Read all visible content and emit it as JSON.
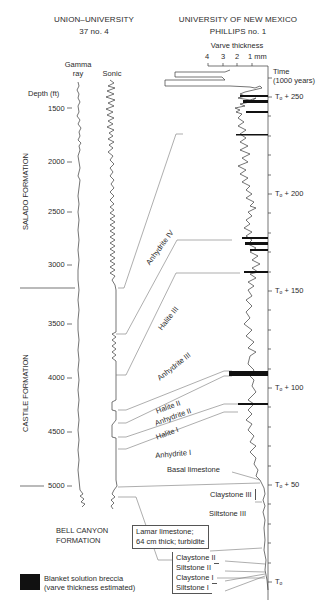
{
  "headers": {
    "left_well": {
      "line1": "UNION–UNIVERSITY",
      "line2": "37 no. 4"
    },
    "right_well": {
      "line1": "UNIVERSITY OF NEW MEXICO",
      "line2": "PHILLIPS no. 1"
    }
  },
  "logs": {
    "gamma_label_1": "Gamma",
    "gamma_label_2": "ray",
    "sonic_label": "Sonic",
    "depth_label": "Depth (ft)",
    "depth_ticks": [
      "1500",
      "2000",
      "2500",
      "3000",
      "3500",
      "4000",
      "4500",
      "5000"
    ]
  },
  "varve": {
    "title": "Varve thickness",
    "ticks": [
      "4",
      "3",
      "2",
      "1 mm"
    ]
  },
  "time_axis": {
    "title_1": "Time",
    "title_2": "(1000 years)",
    "labels": [
      {
        "base": "T",
        "sub": "o",
        "suffix": " + 250"
      },
      {
        "base": "T",
        "sub": "o",
        "suffix": " + 200"
      },
      {
        "base": "T",
        "sub": "o",
        "suffix": " + 150"
      },
      {
        "base": "T",
        "sub": "o",
        "suffix": " + 100"
      },
      {
        "base": "T",
        "sub": "o",
        "suffix": " + 50"
      },
      {
        "base": "T",
        "sub": "o",
        "suffix": ""
      }
    ]
  },
  "formations": {
    "salado": "SALADO FORMATION",
    "castile": "CASTILE FORMATION",
    "bell_canyon_1": "BELL CANYON",
    "bell_canyon_2": "FORMATION"
  },
  "units": {
    "anhydrite_iv": "Anhydrite IV",
    "halite_iii": "Halite III",
    "anhydrite_iii": "Anhydrite III",
    "halite_ii": "Halite II",
    "anhydrite_ii": "Anhydrite II",
    "halite_i": "Halite I",
    "anhydrite_i": "Anhydrite I",
    "basal_limestone": "Basal limestone",
    "claystone_iii": "Claystone III",
    "siltstone_iii": "Siltstone III",
    "lamar_1": "Lamar limestone;",
    "lamar_2": "64 cm thick; turbidite",
    "claystone_ii": "Claystone II",
    "siltstone_ii": "Siltstone II",
    "claystone_i": "Claystone I",
    "siltstone_i": "Siltstone I"
  },
  "legend": {
    "swatch_color": "#111111",
    "line1": "Blanket solution breccia",
    "line2": "(varve thickness estimated)"
  },
  "colors": {
    "line": "#3a3a3a",
    "correlation": "#777777",
    "text": "#2b2b2b"
  }
}
